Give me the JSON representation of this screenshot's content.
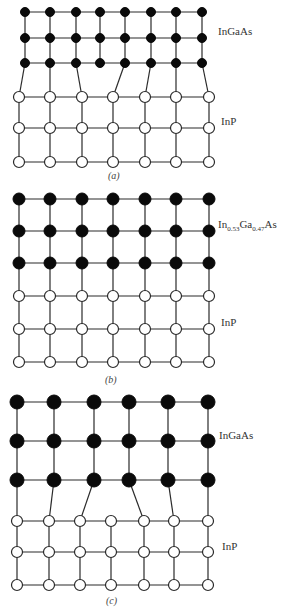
{
  "panels": [
    {
      "id": "a",
      "caption": "(a)",
      "caption_pos": [
        108,
        170
      ],
      "top_layer": {
        "label": "InGaAs",
        "label_pos": [
          218,
          32
        ],
        "atom_type": "black",
        "radius": 4.5,
        "xs": [
          25,
          50,
          76,
          100,
          125,
          151,
          176,
          202
        ],
        "ys": [
          12,
          38,
          63
        ]
      },
      "bottom_layer": {
        "label": "InP",
        "label_pos": [
          221,
          122
        ],
        "atom_type": "white",
        "radius": 5.5,
        "xs": [
          19,
          50,
          82,
          113,
          145,
          176,
          209
        ],
        "ys": [
          97,
          128,
          162
        ]
      },
      "interface_bonds": [
        [
          0,
          0
        ],
        [
          1,
          1
        ],
        [
          2,
          2
        ],
        [
          4,
          3
        ],
        [
          5,
          4
        ],
        [
          6,
          5
        ],
        [
          7,
          6
        ]
      ],
      "description": "Lattice-mismatched: smaller-lattice InGaAs (8 atoms/row) on InP (7 atoms/row), misfit dislocation with dangling bond"
    },
    {
      "id": "b",
      "caption": "(b)",
      "caption_pos": [
        105,
        374
      ],
      "top_layer": {
        "label": "In0.53Ga0.47As",
        "label_main": "In",
        "label_sub1": "0.53",
        "label_mid": "Ga",
        "label_sub2": "0.47",
        "label_end": "As",
        "label_pos": [
          218,
          225
        ],
        "atom_type": "black",
        "radius": 6,
        "xs": [
          19,
          50,
          82,
          113,
          145,
          176,
          209
        ],
        "ys": [
          199,
          231,
          263
        ]
      },
      "bottom_layer": {
        "label": "InP",
        "label_pos": [
          221,
          323
        ],
        "atom_type": "white",
        "radius": 5.5,
        "xs": [
          19,
          50,
          82,
          113,
          145,
          176,
          209
        ],
        "ys": [
          296,
          329,
          362
        ]
      },
      "interface_bonds": [
        [
          0,
          0
        ],
        [
          1,
          1
        ],
        [
          2,
          2
        ],
        [
          3,
          3
        ],
        [
          4,
          4
        ],
        [
          5,
          5
        ],
        [
          6,
          6
        ]
      ],
      "description": "Lattice-matched In0.53Ga0.47As on InP"
    },
    {
      "id": "c",
      "caption": "(c)",
      "caption_pos": [
        106,
        595
      ],
      "top_layer": {
        "label": "InGaAs",
        "label_pos": [
          219,
          436
        ],
        "atom_type": "black",
        "radius": 7,
        "xs": [
          17,
          54,
          94,
          129,
          168,
          208
        ],
        "ys": [
          402,
          441,
          480
        ]
      },
      "bottom_layer": {
        "label": "InP",
        "label_pos": [
          222,
          547
        ],
        "atom_type": "white",
        "radius": 5.5,
        "xs": [
          17,
          49,
          80,
          111,
          144,
          174,
          208
        ],
        "ys": [
          521,
          552,
          585
        ]
      },
      "interface_bonds": [
        [
          0,
          0
        ],
        [
          1,
          1
        ],
        [
          2,
          2
        ],
        [
          3,
          4
        ],
        [
          4,
          5
        ],
        [
          5,
          6
        ]
      ],
      "description": "Lattice-mismatched: larger-lattice InGaAs (6 atoms/row) on InP (7 atoms/row), misfit dislocation"
    }
  ]
}
